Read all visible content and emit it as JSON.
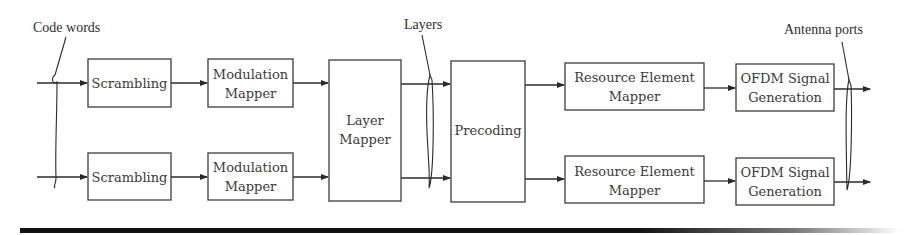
{
  "diagram": {
    "labels": {
      "code_words": "Code words",
      "layers": "Layers",
      "antenna_ports": "Antenna ports"
    },
    "blocks": {
      "scrambling_1": {
        "line1": "Scrambling"
      },
      "scrambling_2": {
        "line1": "Scrambling"
      },
      "modulation_1": {
        "line1": "Modulation",
        "line2": "Mapper"
      },
      "modulation_2": {
        "line1": "Modulation",
        "line2": "Mapper"
      },
      "layer_mapper": {
        "line1": "Layer",
        "line2": "Mapper"
      },
      "precoding": {
        "line1": "Precoding"
      },
      "re_mapper_1": {
        "line1": "Resource Element",
        "line2": "Mapper"
      },
      "re_mapper_2": {
        "line1": "Resource Element",
        "line2": "Mapper"
      },
      "ofdm_1": {
        "line1": "OFDM Signal",
        "line2": "Generation"
      },
      "ofdm_2": {
        "line1": "OFDM Signal",
        "line2": "Generation"
      }
    },
    "flow": [
      "Code words",
      "Scrambling",
      "Modulation Mapper",
      "Layer Mapper",
      "Layers",
      "Precoding",
      "Resource Element Mapper",
      "OFDM Signal Generation",
      "Antenna ports"
    ],
    "branches": 2,
    "colors": {
      "stroke": "#3c3c3c",
      "text": "#3a3a3a",
      "rule": "#111111"
    }
  }
}
